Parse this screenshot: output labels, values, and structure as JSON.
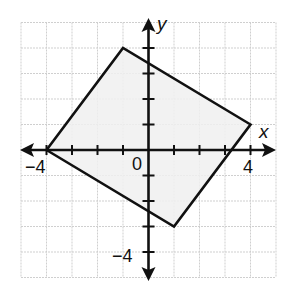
{
  "graph": {
    "x_axis_label": "x",
    "y_axis_label": "y",
    "origin_label": "0",
    "x_tick_labels": [
      {
        "value": -4,
        "text": "−4"
      },
      {
        "value": 4,
        "text": "4"
      }
    ],
    "y_tick_labels": [
      {
        "value": -4,
        "text": "−4"
      }
    ],
    "x_range": [
      -5,
      5
    ],
    "y_range": [
      -5,
      5
    ],
    "grid_color": "#cfcfcf",
    "fill_color": "#f0f0f0",
    "stroke_color": "#111111"
  },
  "polygon": {
    "name": "quadrilateral",
    "vertices": [
      [
        -4,
        0
      ],
      [
        -1,
        4
      ],
      [
        4,
        1
      ],
      [
        1,
        -3
      ]
    ]
  }
}
